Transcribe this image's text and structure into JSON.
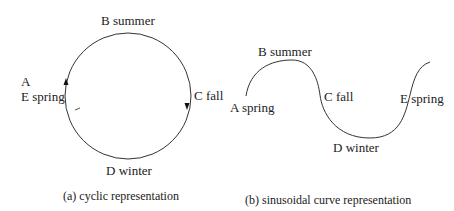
{
  "panel_a": {
    "caption": "(a) cyclic representation",
    "labels": {
      "a": "A",
      "e_spring": "E spring",
      "b_summer": "B summer",
      "c_fall": "C fall",
      "d_winter": "D winter"
    }
  },
  "panel_b": {
    "caption": "(b) sinusoidal curve representation",
    "labels": {
      "a_spring": "A spring",
      "b_summer": "B summer",
      "c_fall": "C fall",
      "d_winter": "D winter",
      "e_spring": "E spring"
    }
  },
  "colors": {
    "stroke": "#333333",
    "text": "#222222"
  }
}
